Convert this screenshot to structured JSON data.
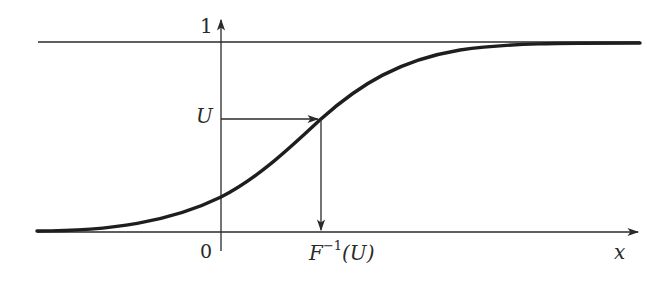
{
  "diagram": {
    "title": "",
    "labels": {
      "y_top": "1",
      "y_value": "U",
      "origin": "0",
      "x_value_base": "F",
      "x_value_sup": "−1",
      "x_value_arg": "(U)",
      "x_axis": "x"
    },
    "elements": {
      "x_axis": {
        "x1": 37,
        "x2": 640,
        "y": 232,
        "arrow": "right"
      },
      "y_axis": {
        "x": 221,
        "y1": 250,
        "y2": 20,
        "arrow": "up"
      },
      "asymptote_1": {
        "x1": 38,
        "x2": 640,
        "y": 42
      },
      "cdf_curve": {
        "start": [
          37,
          231
        ],
        "y_intercept": [
          221,
          197
        ],
        "mid": [
          321,
          119
        ],
        "end": [
          640,
          43
        ]
      },
      "horizontal_arrow": {
        "from": [
          221,
          119
        ],
        "to": [
          321,
          119
        ]
      },
      "vertical_arrow": {
        "from": [
          321,
          119
        ],
        "to": [
          321,
          232
        ]
      }
    },
    "colors": {
      "ink": "#2a2a2a",
      "curve": "#1e1e1e",
      "background": "#ffffff"
    }
  }
}
